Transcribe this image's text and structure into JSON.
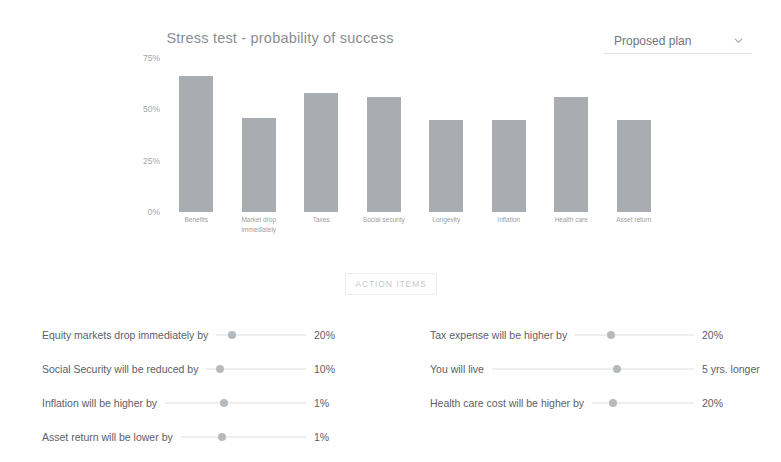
{
  "header": {
    "title": "Stress test - probability of success",
    "plan_selector": {
      "value": "Proposed plan",
      "chevron_icon": "chevron-down-icon"
    }
  },
  "chart_data": {
    "type": "bar",
    "title": "Stress test - probability of success",
    "xlabel": "",
    "ylabel": "",
    "ylim": [
      0,
      75
    ],
    "grid": false,
    "legend": "none",
    "bar_color": "#a9acb0",
    "ytick_labels": [
      "75%",
      "50%",
      "25%",
      "0%"
    ],
    "ytick_values": [
      75,
      50,
      25,
      0
    ],
    "categories": [
      "Benefits",
      "Market drop immediately",
      "Taxes",
      "Social security",
      "Longevity",
      "Inflation",
      "Health care",
      "Asset return"
    ],
    "values": [
      66,
      46,
      58,
      56,
      45,
      45,
      56,
      45
    ]
  },
  "action_items": {
    "label": "ACTION ITEMS"
  },
  "sliders": {
    "left_column": [
      {
        "label": "Equity markets drop immediately by",
        "value": "20%",
        "thumb_percent": 18
      },
      {
        "label": "Social Security will be reduced by",
        "value": "10%",
        "thumb_percent": 14
      },
      {
        "label": "Inflation will be higher by",
        "value": "1%",
        "thumb_percent": 42
      },
      {
        "label": "Asset return will be lower by",
        "value": "1%",
        "thumb_percent": 33
      }
    ],
    "right_column": [
      {
        "label": "Tax expense will be higher by",
        "value": "20%",
        "thumb_percent": 30
      },
      {
        "label": "You will live",
        "value": "5 yrs. longer",
        "thumb_percent": 62
      },
      {
        "label": "Health care cost will be higher by",
        "value": "20%",
        "thumb_percent": 21
      }
    ]
  }
}
